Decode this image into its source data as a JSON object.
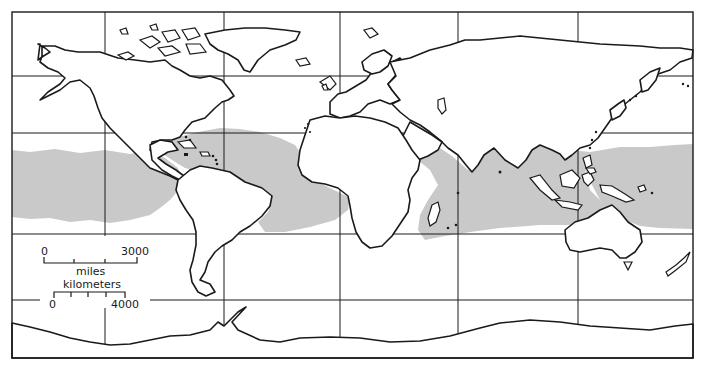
{
  "map": {
    "title": "",
    "shaded_region_color": "#c9c9c9",
    "shaded_region_meaning": "tropical ocean zone (shaded)",
    "scale_bar": {
      "miles": {
        "unit_label": "miles",
        "start_label": "0",
        "end_label": "3000"
      },
      "kilometers": {
        "unit_label": "kilometers",
        "start_label": "0",
        "end_label": "4000"
      }
    }
  }
}
